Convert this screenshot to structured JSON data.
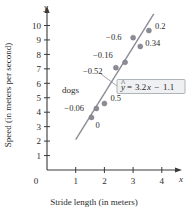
{
  "chart_data": {
    "type": "scatter",
    "title": "",
    "xlabel": "Stride length (in meters)",
    "ylabel": "Speed (in meters per second)",
    "x_axis_variable": "x",
    "y_axis_variable": "y",
    "xlim": [
      0,
      4.6
    ],
    "ylim": [
      0,
      10.8
    ],
    "xticks": [
      1,
      2,
      3,
      4
    ],
    "xtick_labels": [
      "1",
      "2",
      "3",
      "4"
    ],
    "yticks": [
      1,
      2,
      3,
      4,
      5,
      6,
      7,
      8,
      9,
      10
    ],
    "ytick_labels": [
      "1",
      "2",
      "3",
      "4",
      "5",
      "6",
      "7",
      "8",
      "9",
      "10"
    ],
    "origin_label": "0",
    "grid": false,
    "legend": null,
    "group_label": "dogs",
    "regression_equation": "3.2x  1.1",
    "equation_lhs": "y",
    "equation_hat": "^",
    "equation_eq": "=",
    "equation_slope": "3.2",
    "equation_slope_var": "x",
    "equation_minus": "−",
    "equation_intercept": "1.1",
    "regression_line": {
      "slope": 3.2,
      "intercept": -1.1,
      "x_start": 1.0,
      "x_end": 3.72
    },
    "point_color": "#8c8c96",
    "line_color": "#8c8c96",
    "axis_color": "#3a3a3a",
    "box_fill": "#eef0f2",
    "box_border": "#9aa3ab",
    "points": [
      {
        "x": 1.55,
        "y": 3.64,
        "residual_label": "0",
        "label_dx": 4,
        "label_dy": 11
      },
      {
        "x": 1.72,
        "y": 4.26,
        "residual_label": "−0.06",
        "label_dx": -32,
        "label_dy": 3
      },
      {
        "x": 2.0,
        "y": 4.6,
        "residual_label": "0.5",
        "label_dx": 6,
        "label_dy": -3
      },
      {
        "x": 2.4,
        "y": 7.08,
        "residual_label": "−0.52",
        "label_dx": -33,
        "label_dy": 6
      },
      {
        "x": 2.72,
        "y": 7.45,
        "residual_label": "−0.16",
        "label_dx": -32,
        "label_dy": -4
      },
      {
        "x": 3.0,
        "y": 9.16,
        "residual_label": "−0.6",
        "label_dx": -27,
        "label_dy": 2
      },
      {
        "x": 3.25,
        "y": 8.55,
        "residual_label": "0.34",
        "label_dx": 5,
        "label_dy": 0
      },
      {
        "x": 3.55,
        "y": 9.65,
        "residual_label": "0.2",
        "label_dx": 6,
        "label_dy": -2
      }
    ]
  }
}
